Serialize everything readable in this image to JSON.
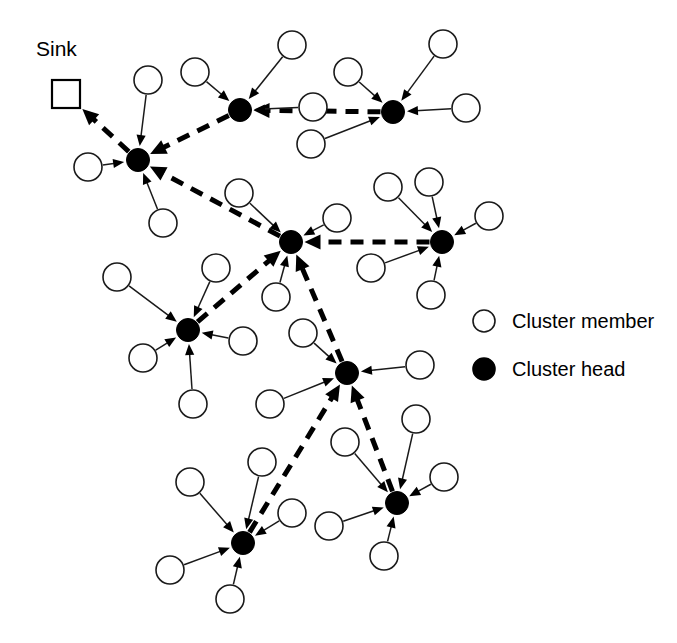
{
  "figure": {
    "background_color": "#ffffff",
    "ink_color": "#000000",
    "width": 677,
    "height": 643
  },
  "sink": {
    "label": "Sink",
    "shape": "square",
    "x": 66,
    "y": 94,
    "size": 28,
    "label_x": 36,
    "label_y": 56
  },
  "legend": {
    "position": "right-middle",
    "items": [
      {
        "label": "Cluster member",
        "marker": "open-circle",
        "marker_fill": "#ffffff",
        "marker_stroke": "#1a1a1a",
        "marker_x": 484,
        "marker_y": 321,
        "text_x": 512,
        "text_y": 328
      },
      {
        "label": "Cluster head",
        "marker": "filled-circle",
        "marker_fill": "#000000",
        "marker_stroke": "#000000",
        "marker_x": 484,
        "marker_y": 369,
        "text_x": 512,
        "text_y": 376
      }
    ]
  },
  "node_styles": {
    "member_radius": 14,
    "head_radius": 11.5,
    "legend_marker_radius": 11
  },
  "cluster_heads": [
    {
      "id": "ch-top-left",
      "x": 138,
      "y": 160
    },
    {
      "id": "ch-top-mid",
      "x": 240,
      "y": 110
    },
    {
      "id": "ch-top-right",
      "x": 393,
      "y": 112
    },
    {
      "id": "ch-center",
      "x": 291,
      "y": 242
    },
    {
      "id": "ch-right-mid",
      "x": 442,
      "y": 242
    },
    {
      "id": "ch-left-mid",
      "x": 188,
      "y": 330
    },
    {
      "id": "ch-mid-bottom",
      "x": 347,
      "y": 373
    },
    {
      "id": "ch-bottom-left",
      "x": 243,
      "y": 543
    },
    {
      "id": "ch-bottom-right",
      "x": 397,
      "y": 503
    }
  ],
  "cluster_members": [
    {
      "id": "m1",
      "x": 148,
      "y": 80,
      "head": "ch-top-left"
    },
    {
      "id": "m2",
      "x": 88,
      "y": 167,
      "head": "ch-top-left"
    },
    {
      "id": "m3",
      "x": 163,
      "y": 223,
      "head": "ch-top-left"
    },
    {
      "id": "m4",
      "x": 292,
      "y": 45,
      "head": "ch-top-mid"
    },
    {
      "id": "m5",
      "x": 195,
      "y": 72,
      "head": "ch-top-mid"
    },
    {
      "id": "m6",
      "x": 313,
      "y": 107,
      "head": "ch-top-mid"
    },
    {
      "id": "m7",
      "x": 348,
      "y": 72,
      "head": "ch-top-right"
    },
    {
      "id": "m8",
      "x": 443,
      "y": 44,
      "head": "ch-top-right"
    },
    {
      "id": "m9",
      "x": 466,
      "y": 108,
      "head": "ch-top-right"
    },
    {
      "id": "m10",
      "x": 311,
      "y": 144,
      "head": "ch-top-right"
    },
    {
      "id": "m11",
      "x": 239,
      "y": 193,
      "head": "ch-center"
    },
    {
      "id": "m12",
      "x": 337,
      "y": 218,
      "head": "ch-center"
    },
    {
      "id": "m13",
      "x": 276,
      "y": 297,
      "head": "ch-center"
    },
    {
      "id": "m14",
      "x": 388,
      "y": 187,
      "head": "ch-right-mid"
    },
    {
      "id": "m15",
      "x": 429,
      "y": 182,
      "head": "ch-right-mid"
    },
    {
      "id": "m16",
      "x": 489,
      "y": 216,
      "head": "ch-right-mid"
    },
    {
      "id": "m17",
      "x": 371,
      "y": 268,
      "head": "ch-right-mid"
    },
    {
      "id": "m18",
      "x": 431,
      "y": 295,
      "head": "ch-right-mid"
    },
    {
      "id": "m19",
      "x": 117,
      "y": 277,
      "head": "ch-left-mid"
    },
    {
      "id": "m20",
      "x": 216,
      "y": 268,
      "head": "ch-left-mid"
    },
    {
      "id": "m21",
      "x": 143,
      "y": 358,
      "head": "ch-left-mid"
    },
    {
      "id": "m22",
      "x": 243,
      "y": 341,
      "head": "ch-left-mid"
    },
    {
      "id": "m23",
      "x": 193,
      "y": 404,
      "head": "ch-left-mid"
    },
    {
      "id": "m24",
      "x": 303,
      "y": 333,
      "head": "ch-mid-bottom"
    },
    {
      "id": "m25",
      "x": 420,
      "y": 365,
      "head": "ch-mid-bottom"
    },
    {
      "id": "m26",
      "x": 270,
      "y": 404,
      "head": "ch-mid-bottom"
    },
    {
      "id": "m27",
      "x": 190,
      "y": 482,
      "head": "ch-bottom-left"
    },
    {
      "id": "m28",
      "x": 262,
      "y": 462,
      "head": "ch-bottom-left"
    },
    {
      "id": "m29",
      "x": 292,
      "y": 513,
      "head": "ch-bottom-left"
    },
    {
      "id": "m30",
      "x": 170,
      "y": 570,
      "head": "ch-bottom-left"
    },
    {
      "id": "m31",
      "x": 230,
      "y": 599,
      "head": "ch-bottom-left"
    },
    {
      "id": "m32",
      "x": 345,
      "y": 442,
      "head": "ch-bottom-right"
    },
    {
      "id": "m33",
      "x": 416,
      "y": 419,
      "head": "ch-bottom-right"
    },
    {
      "id": "m34",
      "x": 444,
      "y": 477,
      "head": "ch-bottom-right"
    },
    {
      "id": "m35",
      "x": 329,
      "y": 526,
      "head": "ch-bottom-right"
    },
    {
      "id": "m36",
      "x": 384,
      "y": 556,
      "head": "ch-bottom-right"
    }
  ],
  "backbone_routes": [
    {
      "from": "ch-top-left",
      "to": "sink",
      "style": "dashed"
    },
    {
      "from": "ch-top-mid",
      "to": "ch-top-left",
      "style": "dashed"
    },
    {
      "from": "ch-top-right",
      "to": "ch-top-mid",
      "style": "dashed"
    },
    {
      "from": "ch-center",
      "to": "ch-top-left",
      "style": "dashed"
    },
    {
      "from": "ch-right-mid",
      "to": "ch-center",
      "style": "dashed"
    },
    {
      "from": "ch-left-mid",
      "to": "ch-center",
      "style": "dashed"
    },
    {
      "from": "ch-mid-bottom",
      "to": "ch-center",
      "style": "dashed"
    },
    {
      "from": "ch-bottom-left",
      "to": "ch-mid-bottom",
      "style": "dashed"
    },
    {
      "from": "ch-bottom-right",
      "to": "ch-mid-bottom",
      "style": "dashed"
    }
  ]
}
